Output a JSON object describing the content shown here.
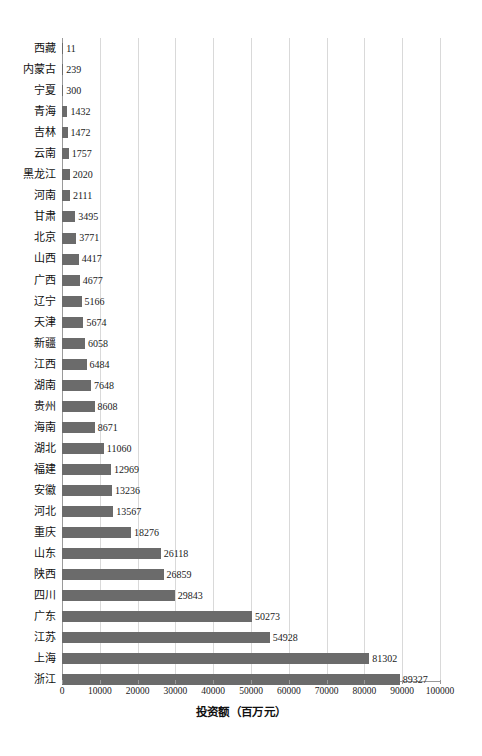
{
  "chart_data": {
    "type": "bar",
    "orientation": "horizontal",
    "title": "",
    "xlabel": "投资额（百万元）",
    "ylabel": "",
    "xlim": [
      0,
      100000
    ],
    "xticks": [
      0,
      10000,
      20000,
      30000,
      40000,
      50000,
      60000,
      70000,
      80000,
      90000,
      100000
    ],
    "xtick_labels": [
      "0",
      "10000",
      "20000",
      "30000",
      "40000",
      "50000",
      "60000",
      "70000",
      "80000",
      "90000",
      "100000"
    ],
    "grid": "vertical",
    "legend": "none",
    "bar_color": "#6b6b6b",
    "grid_color": "#d9d9d9",
    "axis_color": "#9a9a9a",
    "categories": [
      "西藏",
      "内蒙古",
      "宁夏",
      "青海",
      "吉林",
      "云南",
      "黑龙江",
      "河南",
      "甘肃",
      "北京",
      "山西",
      "广西",
      "辽宁",
      "天津",
      "新疆",
      "江西",
      "湖南",
      "贵州",
      "海南",
      "湖北",
      "福建",
      "安徽",
      "河北",
      "重庆",
      "山东",
      "陕西",
      "四川",
      "广东",
      "江苏",
      "上海",
      "浙江"
    ],
    "values": [
      11,
      239,
      300,
      1432,
      1472,
      1757,
      2020,
      2111,
      3495,
      3771,
      4417,
      4677,
      5166,
      5674,
      6058,
      6484,
      7648,
      8608,
      8671,
      11060,
      12969,
      13236,
      13567,
      18276,
      26118,
      26859,
      29843,
      50273,
      54928,
      81302,
      89327
    ],
    "value_labels": [
      "11",
      "239",
      "300",
      "1432",
      "1472",
      "1757",
      "2020",
      "2111",
      "3495",
      "3771",
      "4417",
      "4677",
      "5166",
      "5674",
      "6058",
      "6484",
      "7648",
      "8608",
      "8671",
      "11060",
      "12969",
      "13236",
      "13567",
      "18276",
      "26118",
      "26859",
      "29843",
      "50273",
      "54928",
      "81302",
      "89327"
    ]
  }
}
